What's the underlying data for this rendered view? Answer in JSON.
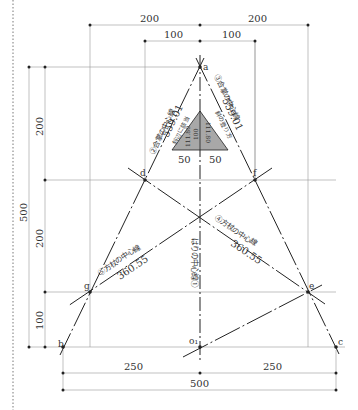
{
  "diagram": {
    "type": "truss-layout-drawing",
    "points": {
      "a": "a",
      "b": "b",
      "c": "c",
      "d": "d",
      "e": "e",
      "f": "f",
      "g": "g",
      "o1": "o₁"
    },
    "top_dimensions": {
      "outer_left": "200",
      "outer_right": "200",
      "inner_left": "100",
      "inner_right": "100"
    },
    "left_dimensions": {
      "total": "500",
      "upper": "200",
      "middle": "200",
      "lower": "100"
    },
    "bottom_dimensions": {
      "left": "250",
      "right": "250",
      "total": "500"
    },
    "inner_triangle": {
      "height": "100",
      "half_base_left": "50",
      "half_base_right": "50",
      "side_left": "111.80",
      "side_right": "111.80",
      "side_left_caption": "斜辺に該当",
      "side_right_caption": "斜の登り方"
    },
    "line_labels": {
      "left_rafter": "②合掌の中心線",
      "left_rafter_prefix": "②",
      "left_rafter_length": "559.01",
      "right_rafter": "③合掌の中心線",
      "right_rafter_length": "559.01",
      "left_strut": "⑤方杖の中心線",
      "left_strut_length": "360.55",
      "right_strut": "④方杖の中心線",
      "right_strut_length": "360.55",
      "center_line": "はりの中心線①"
    },
    "colors": {
      "line": "#222222",
      "guide": "#999999",
      "fill": "#a8a8a8",
      "border_dotted": "#555555"
    }
  }
}
